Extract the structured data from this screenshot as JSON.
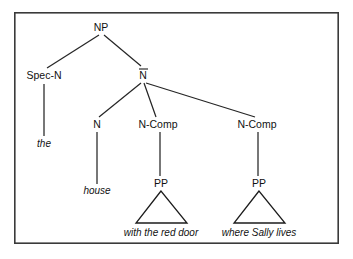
{
  "figure": {
    "kind": "syntax-tree-diagram",
    "caption_text": "",
    "frame": {
      "x": 14,
      "y": 12,
      "width": 325,
      "height": 232,
      "border_color": "#3a3a3a",
      "background_color": "#ffffff"
    },
    "line_color": "#262626",
    "text_color": "#111111"
  },
  "tree": {
    "nodes": {
      "np": {
        "label": "NP",
        "x": 101,
        "y": 31,
        "overbar": false
      },
      "spec_n": {
        "label": "Spec-N",
        "x": 44,
        "y": 79,
        "overbar": false
      },
      "n_bar": {
        "label": "N",
        "x": 143,
        "y": 79,
        "overbar": true
      },
      "n_head": {
        "label": "N",
        "x": 97,
        "y": 128,
        "overbar": false
      },
      "n_comp_1": {
        "label": "N-Comp",
        "x": 158,
        "y": 128,
        "overbar": false
      },
      "n_comp_2": {
        "label": "N-Comp",
        "x": 257,
        "y": 128,
        "overbar": false
      },
      "pp_1": {
        "label": "PP",
        "x": 161,
        "y": 187,
        "overbar": false
      },
      "pp_2": {
        "label": "PP",
        "x": 259,
        "y": 187,
        "overbar": false
      }
    },
    "terminals": {
      "the": {
        "label": "the",
        "x": 44,
        "y": 147
      },
      "house": {
        "label": "house",
        "x": 97,
        "y": 194
      },
      "with_the_red_door": {
        "label": "with the red door",
        "x": 161,
        "y": 236
      },
      "where_sally_lives": {
        "label": "where Sally lives",
        "x": 259,
        "y": 236
      }
    },
    "edges": [
      {
        "name": "np-to-spec-n",
        "x1": 99,
        "y1": 35,
        "x2": 47,
        "y2": 68
      },
      {
        "name": "np-to-n-bar",
        "x1": 104,
        "y1": 35,
        "x2": 141,
        "y2": 66
      },
      {
        "name": "n-bar-to-n",
        "x1": 141,
        "y1": 83,
        "x2": 99,
        "y2": 117
      },
      {
        "name": "n-bar-to-n-comp-1",
        "x1": 144,
        "y1": 83,
        "x2": 156,
        "y2": 117
      },
      {
        "name": "n-bar-to-n-comp-2",
        "x1": 146,
        "y1": 83,
        "x2": 255,
        "y2": 117
      }
    ],
    "stems": [
      {
        "name": "spec-n-stem",
        "x": 44,
        "y1": 84,
        "y2": 136
      },
      {
        "name": "n-head-stem",
        "x": 97,
        "y1": 132,
        "y2": 184
      },
      {
        "name": "n-comp-1-stem",
        "x": 160,
        "y1": 132,
        "y2": 176
      },
      {
        "name": "n-comp-2-stem",
        "x": 258,
        "y1": 132,
        "y2": 176
      }
    ],
    "triangles": [
      {
        "name": "pp-1-triangle",
        "apex_x": 161,
        "apex_y": 191,
        "left_x": 136,
        "right_x": 187,
        "base_y": 223
      },
      {
        "name": "pp-2-triangle",
        "apex_x": 259,
        "apex_y": 191,
        "left_x": 234,
        "right_x": 285,
        "base_y": 223
      }
    ],
    "overbars": [
      {
        "name": "n-bar-overline",
        "x1": 139,
        "x2": 148,
        "y": 69
      }
    ]
  }
}
